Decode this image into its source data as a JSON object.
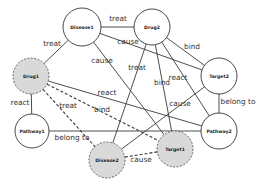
{
  "diagram": {
    "type": "knowledge-graph",
    "nodes": [
      {
        "id": "disease1",
        "label": "Disease1",
        "x": 82,
        "y": 27,
        "r": 19,
        "highlighted": false
      },
      {
        "id": "drug2",
        "label": "Drug2",
        "x": 152,
        "y": 27,
        "r": 18,
        "highlighted": false
      },
      {
        "id": "target2",
        "label": "Target2",
        "x": 219,
        "y": 76,
        "r": 18,
        "highlighted": false
      },
      {
        "id": "drug1",
        "label": "Drug1",
        "x": 31,
        "y": 76,
        "r": 18,
        "highlighted": true
      },
      {
        "id": "pathway1",
        "label": "Pathway1",
        "x": 32,
        "y": 131,
        "r": 17,
        "highlighted": false
      },
      {
        "id": "pathway2",
        "label": "Pathway2",
        "x": 219,
        "y": 131,
        "r": 18,
        "highlighted": false
      },
      {
        "id": "disease2",
        "label": "Disease2",
        "x": 107,
        "y": 160,
        "r": 18,
        "highlighted": true
      },
      {
        "id": "target1",
        "label": "Target1",
        "x": 175,
        "y": 149,
        "r": 18,
        "highlighted": true
      }
    ],
    "edges": [
      {
        "from": "disease1",
        "to": "drug2",
        "label": "treat",
        "style": "solid",
        "lx": 118,
        "ly": 19
      },
      {
        "from": "disease1",
        "to": "drug1",
        "label": "treat",
        "style": "solid",
        "lx": 52,
        "ly": 44
      },
      {
        "from": "disease1",
        "to": "target2",
        "label": "cause",
        "style": "solid",
        "lx": 128,
        "ly": 42
      },
      {
        "from": "disease1",
        "to": "target1",
        "label": "cause",
        "style": "solid",
        "lx": 102,
        "ly": 61
      },
      {
        "from": "drug2",
        "to": "target2",
        "label": "bind",
        "style": "solid",
        "lx": 192,
        "ly": 47
      },
      {
        "from": "drug2",
        "to": "disease2",
        "label": "treat",
        "style": "solid",
        "lx": 137,
        "ly": 68
      },
      {
        "from": "drug2",
        "to": "target1",
        "label": "bind",
        "style": "solid",
        "lx": 162,
        "ly": 83
      },
      {
        "from": "drug2",
        "to": "pathway2",
        "label": "react",
        "style": "solid",
        "lx": 178,
        "ly": 78
      },
      {
        "from": "drug1",
        "to": "pathway1",
        "label": "react",
        "style": "solid",
        "lx": 20,
        "ly": 103
      },
      {
        "from": "drug1",
        "to": "pathway2",
        "label": "react",
        "style": "solid",
        "lx": 107,
        "ly": 93
      },
      {
        "from": "drug1",
        "to": "target1",
        "label": "bind",
        "style": "dashed",
        "lx": 102,
        "ly": 110
      },
      {
        "from": "drug1",
        "to": "disease2",
        "label": "treat",
        "style": "dashed",
        "lx": 68,
        "ly": 106
      },
      {
        "from": "pathway1",
        "to": "pathway2",
        "label": "belong to",
        "style": "solid",
        "lx": 72,
        "ly": 138
      },
      {
        "from": "target2",
        "to": "pathway2",
        "label": "belong to",
        "style": "solid",
        "lx": 238,
        "ly": 102
      },
      {
        "from": "target2",
        "to": "disease2",
        "label": "cause",
        "style": "solid",
        "lx": 180,
        "ly": 104
      },
      {
        "from": "disease2",
        "to": "target1",
        "label": "cause",
        "style": "dashed",
        "lx": 141,
        "ly": 160
      }
    ]
  }
}
